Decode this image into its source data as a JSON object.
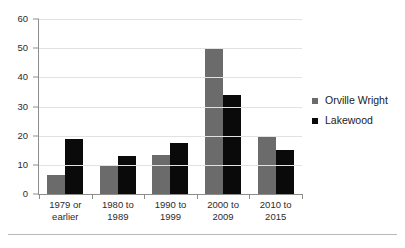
{
  "chart_data": {
    "type": "bar",
    "title": "",
    "subtitle": "",
    "xlabel": "",
    "ylabel": "",
    "categories": [
      "1979 or earlier",
      "1980 to 1989",
      "1990 to 1999",
      "2000 to 2009",
      "2010 to 2015"
    ],
    "category_lines": [
      [
        "1979 or",
        "earlier"
      ],
      [
        "1980 to",
        "1989"
      ],
      [
        "1990 to",
        "1999"
      ],
      [
        "2000 to",
        "2009"
      ],
      [
        "2010 to",
        "2015"
      ]
    ],
    "series": [
      {
        "name": "Orville Wright",
        "color": "#6b6b6b",
        "values": [
          6.5,
          10,
          13.5,
          50,
          20
        ]
      },
      {
        "name": "Lakewood",
        "color": "#0a0a0a",
        "values": [
          19,
          13,
          17.5,
          34,
          15
        ]
      }
    ],
    "ylim": [
      0,
      60
    ],
    "yticks": [
      0,
      10,
      20,
      30,
      40,
      50,
      60
    ],
    "ytick_labels": [
      "0",
      "10",
      "20",
      "30",
      "40",
      "50",
      "60"
    ],
    "grid": true,
    "grid_axis": "y",
    "legend_position": "right"
  },
  "legend": {
    "entries": [
      {
        "label": "Orville Wright",
        "color": "#6b6b6b",
        "marker": "square-marker"
      },
      {
        "label": "Lakewood",
        "color": "#0a0a0a",
        "marker": "square-marker"
      }
    ]
  },
  "colors": {
    "series_orville_wright": "#6b6b6b",
    "series_lakewood": "#0a0a0a",
    "axis": "#8d8d8d",
    "gridline": "#e2e2e2",
    "text": "#1a1a1a",
    "background": "#ffffff",
    "footer_rule": "#b9b9b9"
  }
}
